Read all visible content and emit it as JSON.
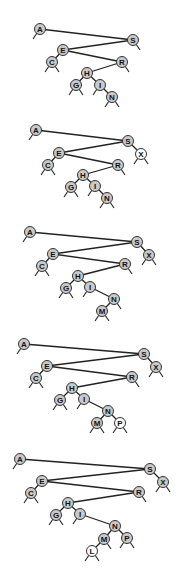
{
  "figure": {
    "colors": {
      "existing_node": "#c9c9c9",
      "new_node": "#ffffff",
      "edge": "#222222"
    },
    "trees": [
      {
        "nodes": [
          {
            "key": "A",
            "x": 40,
            "y": 29,
            "new": false
          },
          {
            "key": "S",
            "x": 133,
            "y": 40,
            "new": false
          },
          {
            "key": "E",
            "x": 63,
            "y": 50,
            "new": false
          },
          {
            "key": "C",
            "x": 52,
            "y": 62,
            "new": false
          },
          {
            "key": "R",
            "x": 122,
            "y": 62,
            "new": false
          },
          {
            "key": "H",
            "x": 87,
            "y": 73,
            "new": false
          },
          {
            "key": "G",
            "x": 76,
            "y": 85,
            "new": false
          },
          {
            "key": "I",
            "x": 100,
            "y": 85,
            "new": false
          },
          {
            "key": "N",
            "x": 112,
            "y": 97,
            "new": false
          }
        ],
        "edges": [
          [
            "A",
            "S"
          ],
          [
            "S",
            "E"
          ],
          [
            "E",
            "C"
          ],
          [
            "E",
            "R"
          ],
          [
            "R",
            "H"
          ],
          [
            "H",
            "G"
          ],
          [
            "H",
            "I"
          ],
          [
            "I",
            "N"
          ]
        ]
      },
      {
        "nodes": [
          {
            "key": "A",
            "x": 36,
            "y": 130,
            "new": false
          },
          {
            "key": "S",
            "x": 128,
            "y": 141,
            "new": false
          },
          {
            "key": "X",
            "x": 141,
            "y": 154,
            "new": true
          },
          {
            "key": "E",
            "x": 59,
            "y": 153,
            "new": false
          },
          {
            "key": "C",
            "x": 48,
            "y": 165,
            "new": false
          },
          {
            "key": "R",
            "x": 118,
            "y": 165,
            "new": false
          },
          {
            "key": "H",
            "x": 83,
            "y": 175,
            "new": false
          },
          {
            "key": "G",
            "x": 71,
            "y": 187,
            "new": false
          },
          {
            "key": "I",
            "x": 95,
            "y": 186,
            "new": false
          },
          {
            "key": "N",
            "x": 107,
            "y": 198,
            "new": false
          }
        ],
        "edges": [
          [
            "A",
            "S"
          ],
          [
            "S",
            "E"
          ],
          [
            "S",
            "X"
          ],
          [
            "E",
            "C"
          ],
          [
            "E",
            "R"
          ],
          [
            "R",
            "H"
          ],
          [
            "H",
            "G"
          ],
          [
            "H",
            "I"
          ],
          [
            "I",
            "N"
          ]
        ]
      },
      {
        "nodes": [
          {
            "key": "A",
            "x": 30,
            "y": 232,
            "new": false
          },
          {
            "key": "S",
            "x": 137,
            "y": 242,
            "new": false
          },
          {
            "key": "X",
            "x": 149,
            "y": 255,
            "new": false
          },
          {
            "key": "E",
            "x": 53,
            "y": 254,
            "new": false
          },
          {
            "key": "C",
            "x": 42,
            "y": 266,
            "new": false
          },
          {
            "key": "R",
            "x": 125,
            "y": 264,
            "new": false
          },
          {
            "key": "H",
            "x": 78,
            "y": 276,
            "new": false
          },
          {
            "key": "G",
            "x": 66,
            "y": 288,
            "new": false
          },
          {
            "key": "I",
            "x": 90,
            "y": 287,
            "new": false
          },
          {
            "key": "N",
            "x": 114,
            "y": 299,
            "new": false
          },
          {
            "key": "M",
            "x": 102,
            "y": 311,
            "new": false
          }
        ],
        "edges": [
          [
            "A",
            "S"
          ],
          [
            "S",
            "E"
          ],
          [
            "S",
            "X"
          ],
          [
            "E",
            "C"
          ],
          [
            "E",
            "R"
          ],
          [
            "R",
            "H"
          ],
          [
            "H",
            "G"
          ],
          [
            "H",
            "I"
          ],
          [
            "I",
            "N"
          ],
          [
            "N",
            "M"
          ]
        ]
      },
      {
        "nodes": [
          {
            "key": "A",
            "x": 24,
            "y": 344,
            "new": false
          },
          {
            "key": "S",
            "x": 144,
            "y": 354,
            "new": false
          },
          {
            "key": "X",
            "x": 156,
            "y": 367,
            "new": false
          },
          {
            "key": "E",
            "x": 47,
            "y": 366,
            "new": false
          },
          {
            "key": "C",
            "x": 36,
            "y": 378,
            "new": false
          },
          {
            "key": "R",
            "x": 132,
            "y": 377,
            "new": false
          },
          {
            "key": "H",
            "x": 72,
            "y": 388,
            "new": false
          },
          {
            "key": "G",
            "x": 60,
            "y": 400,
            "new": false
          },
          {
            "key": "I",
            "x": 84,
            "y": 399,
            "new": false
          },
          {
            "key": "N",
            "x": 108,
            "y": 411,
            "new": false
          },
          {
            "key": "M",
            "x": 97,
            "y": 423,
            "new": false
          },
          {
            "key": "P",
            "x": 120,
            "y": 423,
            "new": true
          }
        ],
        "edges": [
          [
            "A",
            "S"
          ],
          [
            "S",
            "E"
          ],
          [
            "S",
            "X"
          ],
          [
            "E",
            "C"
          ],
          [
            "E",
            "R"
          ],
          [
            "R",
            "H"
          ],
          [
            "H",
            "G"
          ],
          [
            "H",
            "I"
          ],
          [
            "I",
            "N"
          ],
          [
            "N",
            "M"
          ],
          [
            "N",
            "P"
          ]
        ]
      },
      {
        "nodes": [
          {
            "key": "A",
            "x": 20,
            "y": 459,
            "new": false
          },
          {
            "key": "S",
            "x": 150,
            "y": 469,
            "new": false
          },
          {
            "key": "X",
            "x": 163,
            "y": 482,
            "new": false
          },
          {
            "key": "E",
            "x": 42,
            "y": 481,
            "new": false
          },
          {
            "key": "C",
            "x": 31,
            "y": 493,
            "new": false
          },
          {
            "key": "R",
            "x": 139,
            "y": 492,
            "new": false
          },
          {
            "key": "H",
            "x": 68,
            "y": 503,
            "new": false
          },
          {
            "key": "G",
            "x": 56,
            "y": 515,
            "new": false
          },
          {
            "key": "I",
            "x": 80,
            "y": 514,
            "new": false
          },
          {
            "key": "N",
            "x": 115,
            "y": 526,
            "new": false
          },
          {
            "key": "M",
            "x": 104,
            "y": 539,
            "new": false
          },
          {
            "key": "P",
            "x": 127,
            "y": 538,
            "new": false
          },
          {
            "key": "L",
            "x": 92,
            "y": 551,
            "new": true
          }
        ],
        "edges": [
          [
            "A",
            "S"
          ],
          [
            "S",
            "E"
          ],
          [
            "S",
            "X"
          ],
          [
            "E",
            "C"
          ],
          [
            "E",
            "R"
          ],
          [
            "R",
            "H"
          ],
          [
            "H",
            "G"
          ],
          [
            "H",
            "I"
          ],
          [
            "I",
            "N"
          ],
          [
            "N",
            "M"
          ],
          [
            "N",
            "P"
          ],
          [
            "M",
            "L"
          ]
        ]
      }
    ]
  }
}
